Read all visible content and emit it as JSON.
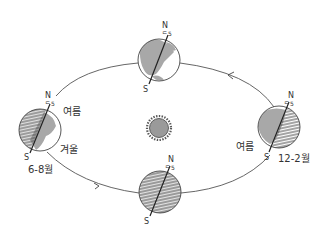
{
  "diagram": {
    "type": "earth-orbit-seasons",
    "colors": {
      "line": "#444444",
      "land": "#a8a8a8",
      "night_hatch": "#333333",
      "sun_fill": "#9a9a9a",
      "sun_ray": "#555555",
      "background": "#ffffff"
    },
    "sun": {
      "label": ""
    },
    "globes": [
      {
        "id": "top",
        "north": "N",
        "south": "S",
        "axis_marker": "ᄃ5",
        "shading": "day"
      },
      {
        "id": "left",
        "north": "N",
        "south": "S",
        "axis_marker": "ᄃ5",
        "shading": "partial-night-left",
        "label_upper": "여름",
        "label_lower": "겨울",
        "months": "6-8월"
      },
      {
        "id": "right",
        "north": "N",
        "south": "S",
        "axis_marker": "ᄃ5",
        "shading": "partial-night-right",
        "label_lower": "여름",
        "months": "12-2월"
      },
      {
        "id": "bottom",
        "north": "N",
        "south": "S",
        "axis_marker": "ᄃ5",
        "shading": "night"
      }
    ],
    "orbit": {
      "direction": "counter-clockwise"
    }
  }
}
